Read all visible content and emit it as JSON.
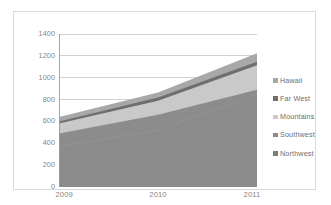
{
  "chart_data": {
    "type": "area",
    "stacked": true,
    "title": "",
    "xlabel": "",
    "ylabel": "",
    "x": [
      "2009",
      "2010",
      "2011"
    ],
    "categories": [
      "2009",
      "2010",
      "2011"
    ],
    "xtick_labels": [
      "2009",
      "2010",
      "2011"
    ],
    "ytick_labels": [
      "0",
      "200",
      "400",
      "600",
      "800",
      "1000",
      "1200",
      "1400"
    ],
    "ytick_values": [
      0,
      200,
      400,
      600,
      800,
      1000,
      1200,
      1400
    ],
    "ylim": [
      0,
      1400
    ],
    "grid": "horizontal",
    "legend_position": "right",
    "series": [
      {
        "name": "Northwest",
        "values": [
          370,
          520,
          850
        ],
        "color": "#8c8c8c"
      },
      {
        "name": "Southwest",
        "values": [
          120,
          140,
          40
        ],
        "color": "#8c8c8c"
      },
      {
        "name": "Mountains",
        "values": [
          90,
          130,
          225
        ],
        "color": "#c9c9c9"
      },
      {
        "name": "Far West",
        "values": [
          20,
          30,
          30
        ],
        "color": "#6f6f6f"
      },
      {
        "name": "Hawaii",
        "values": [
          40,
          45,
          80
        ],
        "color": "#a8a8a8"
      }
    ],
    "cumulative_tops": {
      "Northwest": [
        370,
        520,
        850
      ],
      "Southwest": [
        490,
        660,
        890
      ],
      "Mountains": [
        580,
        790,
        1115
      ],
      "Far West": [
        600,
        820,
        1145
      ],
      "Hawaii": [
        640,
        865,
        1225
      ]
    }
  },
  "legend": {
    "items": [
      {
        "label": "Hawaii",
        "color": "#a8a8a8"
      },
      {
        "label": "Far West",
        "color": "#6f6f6f"
      },
      {
        "label": "Mountains",
        "color": "#c9c9c9"
      },
      {
        "label": "Southwest",
        "color": "#8a8a8a"
      },
      {
        "label": "Northwest",
        "color": "#7d7d7d"
      }
    ]
  },
  "axes": {
    "y_ticks": [
      {
        "label": "1400",
        "value": 1400
      },
      {
        "label": "1200",
        "value": 1200
      },
      {
        "label": "1000",
        "value": 1000
      },
      {
        "label": "800",
        "value": 800
      },
      {
        "label": "600",
        "value": 600
      },
      {
        "label": "400",
        "value": 400
      },
      {
        "label": "200",
        "value": 200
      },
      {
        "label": "0",
        "value": 0
      }
    ],
    "x_ticks": [
      {
        "label": "2009",
        "value": 0
      },
      {
        "label": "2010",
        "value": 1
      },
      {
        "label": "2011",
        "value": 2
      }
    ]
  },
  "colors": {
    "plot_background": "#ffffff",
    "gridline": "#bfbfbf",
    "axis_line": "#9a9a9a",
    "frame_border": "#d9d9d9",
    "tick_text": "#848484",
    "legend_text": "#6e6e6e"
  }
}
